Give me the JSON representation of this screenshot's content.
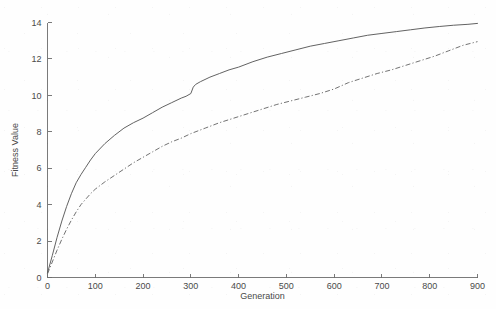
{
  "chart_data": {
    "type": "line",
    "title": "",
    "xlabel": "Generation",
    "ylabel": "Fitness Value",
    "xlim": [
      0,
      900
    ],
    "ylim": [
      0,
      14
    ],
    "xticks": [
      0,
      100,
      200,
      300,
      400,
      500,
      600,
      700,
      800,
      900
    ],
    "yticks": [
      0,
      2,
      4,
      6,
      8,
      10,
      12,
      14
    ],
    "xtick_labels": [
      "0",
      "100",
      "200",
      "300",
      "400",
      "500",
      "600",
      "700",
      "800",
      "900"
    ],
    "ytick_labels": [
      "0",
      "2",
      "4",
      "6",
      "8",
      "10",
      "12",
      "14"
    ],
    "grid": false,
    "legend": "none",
    "background_color": "#ffffff",
    "axis_color": "#6b6b6b",
    "series": [
      {
        "name": "series-1",
        "style": "solid",
        "color": "#5a5a5a",
        "x": [
          0,
          10,
          20,
          30,
          40,
          50,
          60,
          70,
          80,
          90,
          100,
          120,
          140,
          160,
          180,
          200,
          220,
          240,
          260,
          280,
          290,
          300,
          305,
          310,
          320,
          340,
          360,
          380,
          400,
          430,
          460,
          490,
          520,
          550,
          580,
          610,
          640,
          670,
          700,
          730,
          760,
          790,
          820,
          850,
          880,
          900
        ],
        "y": [
          0.25,
          1.2,
          2.2,
          3.1,
          3.9,
          4.6,
          5.2,
          5.65,
          6.05,
          6.45,
          6.8,
          7.35,
          7.8,
          8.2,
          8.5,
          8.75,
          9.05,
          9.35,
          9.6,
          9.85,
          9.95,
          10.1,
          10.45,
          10.6,
          10.75,
          11.0,
          11.2,
          11.4,
          11.55,
          11.85,
          12.1,
          12.3,
          12.5,
          12.7,
          12.85,
          13.0,
          13.15,
          13.3,
          13.4,
          13.5,
          13.6,
          13.7,
          13.78,
          13.85,
          13.9,
          13.95
        ]
      },
      {
        "name": "series-2",
        "style": "dash-dot",
        "color": "#6a6a6a",
        "x": [
          0,
          10,
          20,
          30,
          40,
          50,
          60,
          70,
          80,
          90,
          100,
          120,
          140,
          160,
          180,
          200,
          220,
          240,
          260,
          280,
          300,
          330,
          360,
          390,
          420,
          450,
          480,
          510,
          540,
          570,
          600,
          630,
          660,
          690,
          720,
          750,
          780,
          810,
          840,
          870,
          900
        ],
        "y": [
          0.2,
          0.85,
          1.5,
          2.1,
          2.65,
          3.15,
          3.6,
          4.0,
          4.3,
          4.6,
          4.85,
          5.25,
          5.6,
          5.95,
          6.3,
          6.6,
          6.9,
          7.2,
          7.45,
          7.65,
          7.9,
          8.2,
          8.5,
          8.75,
          9.0,
          9.25,
          9.5,
          9.7,
          9.9,
          10.1,
          10.35,
          10.7,
          10.95,
          11.2,
          11.4,
          11.65,
          11.9,
          12.15,
          12.45,
          12.75,
          12.95
        ]
      }
    ]
  }
}
